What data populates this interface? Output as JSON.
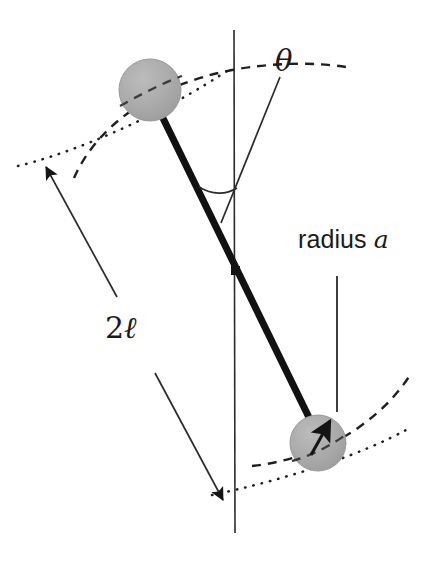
{
  "figure": {
    "background_color": "#ffffff",
    "width": 427,
    "height": 563
  },
  "labels": {
    "theta": "θ",
    "radius_prefix": "radius ",
    "radius_symbol": "a",
    "length_prefix": "2",
    "length_symbol": "ℓ"
  },
  "colors": {
    "sphere_fill": "#a9a9a9",
    "sphere_edge": "#9a9a9a",
    "rod": "#111111",
    "thin_line": "#2b2b2b",
    "dashed_arc": "#1f1f1f",
    "dotted_line": "#1f1f1f",
    "text": "#1a1a1a"
  },
  "geometry": {
    "axis_line": {
      "x": 234,
      "y_top": 30,
      "y_bottom": 533
    },
    "rod": {
      "x1": 159,
      "y1": 110,
      "x2": 320,
      "y2": 440,
      "width": 7
    },
    "rod_midpoint": {
      "x": 236,
      "y": 271
    },
    "sphere_top": {
      "cx": 150,
      "cy": 90,
      "r": 31
    },
    "sphere_bottom": {
      "cx": 318,
      "cy": 443,
      "r": 28
    },
    "theta_ray": {
      "x1": 280,
      "y1": 77,
      "x2": 221,
      "y2": 223
    },
    "theta_arc_vertex": {
      "x": 235,
      "y": 190
    },
    "radius_arrow": {
      "x1": 312,
      "y1": 453,
      "x2": 332,
      "y2": 418
    },
    "radius_leader": {
      "x": 337,
      "y_top": 276,
      "y_bottom": 412
    },
    "leader_upper": {
      "x1": 117,
      "y1": 297,
      "x2": 43,
      "y2": 164
    },
    "leader_lower": {
      "x1": 155,
      "y1": 373,
      "x2": 226,
      "y2": 503
    }
  },
  "elements": {
    "sphere_top_name": "top-sphere",
    "sphere_bottom_name": "bottom-sphere",
    "rod_name": "connecting-rod",
    "axis_name": "rotation-axis"
  }
}
